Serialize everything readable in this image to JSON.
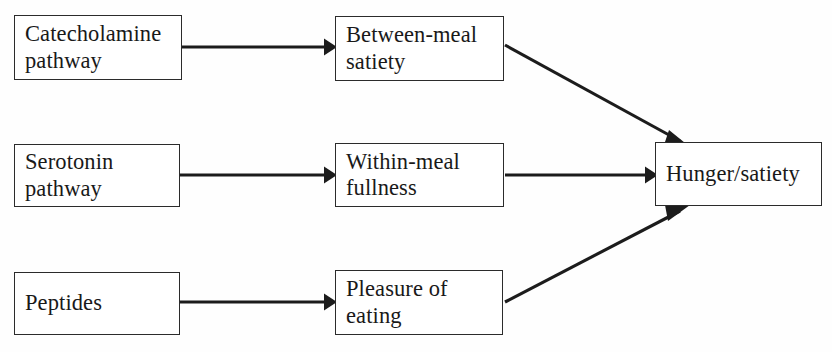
{
  "diagram": {
    "type": "flowchart",
    "background_color": "#fefefe",
    "line_color": "#1c1c1c",
    "box_border_color": "#2b2b2b",
    "box_fill_color": "#ffffff",
    "text_color": "#191919",
    "nodes": [
      {
        "id": "catecholamine",
        "label": "Catecholamine\npathway",
        "column": "left",
        "row": 1
      },
      {
        "id": "serotonin",
        "label": "Serotonin\npathway",
        "column": "left",
        "row": 2
      },
      {
        "id": "peptides",
        "label": "Peptides",
        "column": "left",
        "row": 3
      },
      {
        "id": "between_meal",
        "label": "Between-meal\nsatiety",
        "column": "middle",
        "row": 1
      },
      {
        "id": "within_meal",
        "label": "Within-meal\nfullness",
        "column": "middle",
        "row": 2
      },
      {
        "id": "pleasure",
        "label": "Pleasure of\neating",
        "column": "middle",
        "row": 3
      },
      {
        "id": "hunger",
        "label": "Hunger/satiety",
        "column": "right",
        "row": 2
      }
    ],
    "edges": [
      {
        "id": "e1",
        "from": "catecholamine",
        "to": "between_meal",
        "style": "horizontal-arrow"
      },
      {
        "id": "e2",
        "from": "serotonin",
        "to": "within_meal",
        "style": "horizontal-arrow"
      },
      {
        "id": "e3",
        "from": "peptides",
        "to": "pleasure",
        "style": "horizontal-arrow"
      },
      {
        "id": "e4",
        "from": "between_meal",
        "to": "hunger",
        "style": "diagonal-down-arrow"
      },
      {
        "id": "e5",
        "from": "within_meal",
        "to": "hunger",
        "style": "horizontal-arrow"
      },
      {
        "id": "e6",
        "from": "pleasure",
        "to": "hunger",
        "style": "diagonal-up-arrow"
      }
    ]
  }
}
